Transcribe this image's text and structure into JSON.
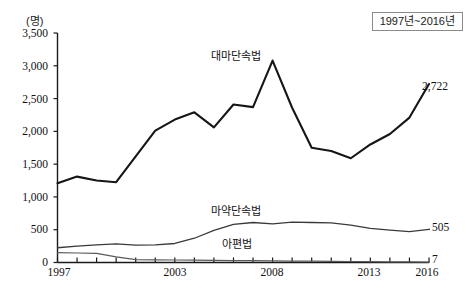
{
  "chart_data": {
    "type": "line",
    "title": "",
    "xlabel": "",
    "ylabel": "(명)",
    "y_unit_label": "(명)",
    "xlim": [
      1997,
      2016
    ],
    "ylim": [
      0,
      3500
    ],
    "y_ticks": [
      0,
      500,
      1000,
      1500,
      2000,
      2500,
      3000,
      3500
    ],
    "y_tick_labels": [
      "0",
      "500",
      "1,000",
      "1,500",
      "2,000",
      "2,500",
      "3,000",
      "3,500"
    ],
    "x_ticks": [
      1997,
      1998,
      1999,
      2000,
      2001,
      2002,
      2003,
      2004,
      2005,
      2006,
      2007,
      2008,
      2009,
      2010,
      2011,
      2012,
      2013,
      2014,
      2015,
      2016
    ],
    "x_tick_labels_shown": [
      "1997",
      "2003",
      "2008",
      "2013",
      "2016"
    ],
    "grid": false,
    "legend_position": "inline-annotation",
    "x": [
      1997,
      1998,
      1999,
      2000,
      2001,
      2002,
      2003,
      2004,
      2005,
      2006,
      2007,
      2008,
      2009,
      2010,
      2011,
      2012,
      2013,
      2014,
      2015,
      2016
    ],
    "series": [
      {
        "name": "대마단속법",
        "label": "대마단속법",
        "end_value_label": "2,722",
        "color": "#161616",
        "values": [
          1210,
          1310,
          1250,
          1225,
          1620,
          2010,
          2180,
          2290,
          2060,
          2410,
          2370,
          3080,
          2360,
          1750,
          1700,
          1590,
          1800,
          1960,
          2210,
          2722
        ]
      },
      {
        "name": "마약단속법",
        "label": "마약단속법",
        "end_value_label": "505",
        "color": "#3a3a3a",
        "values": [
          225,
          250,
          270,
          285,
          265,
          270,
          290,
          370,
          490,
          580,
          610,
          590,
          615,
          610,
          605,
          570,
          520,
          495,
          470,
          505
        ]
      },
      {
        "name": "아편법",
        "label": "아편법",
        "end_value_label": "7",
        "color": "#5a5a5a",
        "values": [
          150,
          145,
          140,
          85,
          45,
          40,
          38,
          35,
          32,
          30,
          28,
          25,
          22,
          20,
          18,
          15,
          12,
          10,
          9,
          7
        ]
      }
    ],
    "period_badge": "1997년~2016년",
    "annotations": [
      {
        "text": "대마단속법",
        "series": "대마단속법"
      },
      {
        "text": "마약단속법",
        "series": "마약단속법"
      },
      {
        "text": "아편법",
        "series": "아편법"
      },
      {
        "text": "2,722",
        "series": "대마단속법"
      },
      {
        "text": "505",
        "series": "마약단속법"
      },
      {
        "text": "7",
        "series": "아편법"
      }
    ]
  },
  "labels": {
    "y_unit": "(명)",
    "period": "1997년~2016년",
    "series1": "대마단속법",
    "series2": "마약단속법",
    "series3": "아편법",
    "end1": "2,722",
    "end2": "505",
    "end3": "7",
    "y0": "0",
    "y500": "500",
    "y1000": "1,000",
    "y1500": "1,500",
    "y2000": "2,000",
    "y2500": "2,500",
    "y3000": "3,000",
    "y3500": "3,500",
    "x1997": "1997",
    "x2003": "2003",
    "x2008": "2008",
    "x2013": "2013",
    "x2016": "2016"
  }
}
